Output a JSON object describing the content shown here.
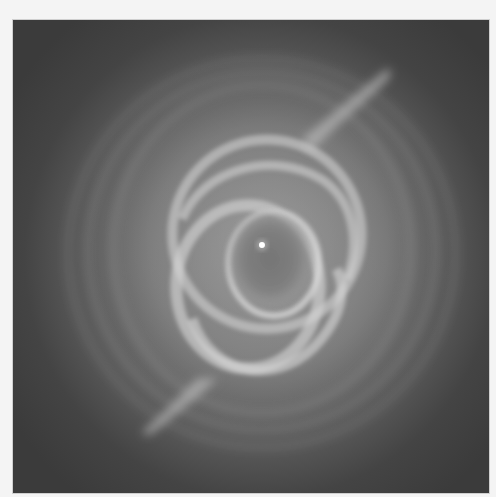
{
  "image": {
    "subject": "planetary nebula (grayscale space telescope photo)",
    "colors": {
      "background_outer": "#f4f4f4",
      "image_edge": "#3b3b3b",
      "halo": "#7a7a7a",
      "shell": "#d6d6d6",
      "star": "#ffffff"
    },
    "central_star": {
      "x": 262,
      "y": 245
    }
  }
}
